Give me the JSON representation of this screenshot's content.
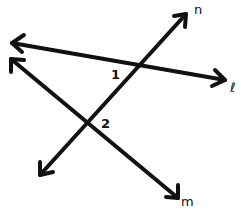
{
  "diagram": {
    "type": "intersecting-lines",
    "lines": [
      {
        "id": "l",
        "label": "ℓ",
        "from": [
          12,
          43
        ],
        "to": [
          225,
          80
        ],
        "label_pos": [
          232,
          82
        ]
      },
      {
        "id": "n",
        "label": "n",
        "from": [
          40,
          175
        ],
        "to": [
          186,
          14
        ],
        "label_pos": [
          194,
          3
        ]
      },
      {
        "id": "m",
        "label": "m",
        "from": [
          11,
          59
        ],
        "to": [
          178,
          198
        ],
        "label_pos": [
          181,
          196
        ]
      }
    ],
    "angles": [
      {
        "id": "1",
        "label": "1",
        "between": [
          "l",
          "n"
        ],
        "label_pos": [
          111,
          68
        ]
      },
      {
        "id": "2",
        "label": "2",
        "between": [
          "n",
          "m"
        ],
        "label_pos": [
          101,
          117
        ]
      }
    ],
    "colors": {
      "stroke": "#111111",
      "background": "#ffffff"
    }
  }
}
